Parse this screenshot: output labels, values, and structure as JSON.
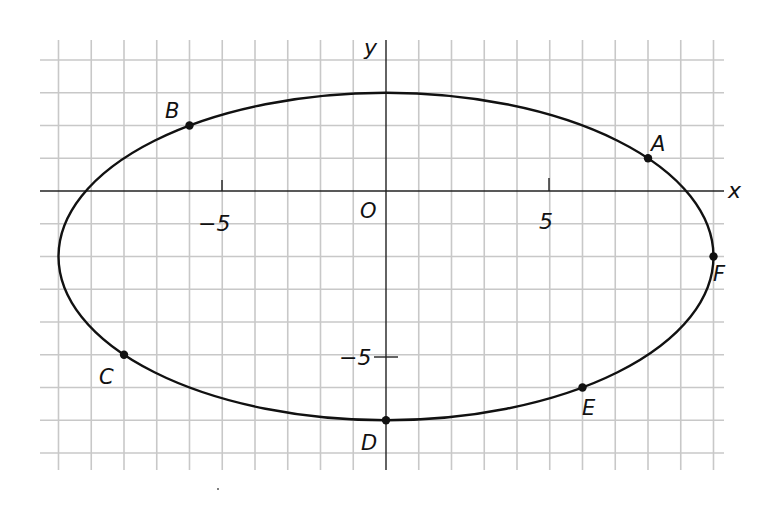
{
  "figure": {
    "axis_labels": {
      "x": "x",
      "y": "y",
      "origin": "O"
    },
    "tick_labels": {
      "x_neg": "-5",
      "x_pos": "5",
      "y_neg": "-5"
    },
    "colors": {
      "grid": "#c8c8c8",
      "axis": "#222222",
      "curve": "#111111",
      "point": "#111111",
      "background": "#ffffff"
    }
  },
  "chart_data": {
    "type": "scatter",
    "title": "",
    "subtitle": "",
    "xlabel": "x",
    "ylabel": "y",
    "xlim": [
      -10,
      10
    ],
    "ylim": [
      -8,
      4
    ],
    "grid": true,
    "grid_step": 1,
    "legend": null,
    "x_ticks_labeled": [
      -5,
      5
    ],
    "y_ticks_labeled": [
      -5
    ],
    "origin_label": "O",
    "curve": {
      "type": "ellipse",
      "center": [
        0,
        -2
      ],
      "semi_axis_x": 10,
      "semi_axis_y": 5,
      "equation": "x^2/100 + (y+2)^2/25 = 1"
    },
    "points": [
      {
        "label": "A",
        "x": 8,
        "y": 1
      },
      {
        "label": "B",
        "x": -6,
        "y": 2
      },
      {
        "label": "C",
        "x": -8,
        "y": -5
      },
      {
        "label": "D",
        "x": 0,
        "y": -7
      },
      {
        "label": "E",
        "x": 6,
        "y": -6
      },
      {
        "label": "F",
        "x": 10,
        "y": -2
      }
    ]
  }
}
